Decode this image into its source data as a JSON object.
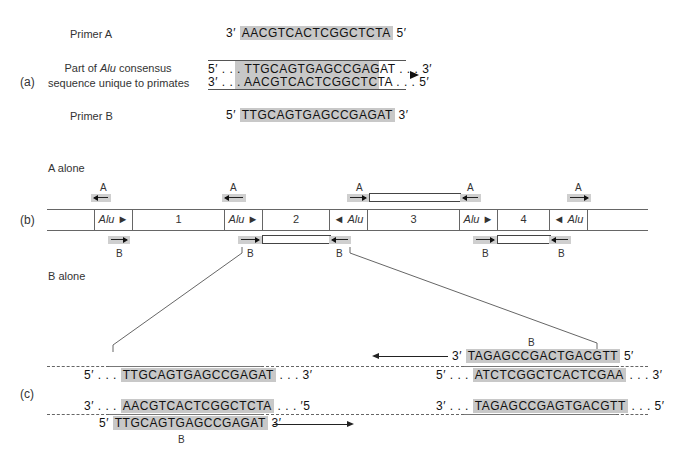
{
  "panel_a": {
    "label": "(a)",
    "primer_a": {
      "name": "Primer A",
      "left_end": "3′",
      "sequence": "AACGTCACTCGGCTCTA",
      "right_end": "5′"
    },
    "consensus": {
      "name_prefix": "Part of ",
      "name_italic": "Alu",
      "name_suffix": " consensus",
      "name_line2": "sequence unique to primates",
      "top_strand": {
        "left_end": "5′ . . .",
        "sequence": "TTGCAGTGAGCCGAGAT",
        "right_end": ". . . 3′"
      },
      "bottom_strand": {
        "left_end": "3′ . . .",
        "sequence": "AACGTCACTCGGCTCTA",
        "right_end": ". . . 5′"
      },
      "direction_icon": "right-arrowhead"
    },
    "primer_b": {
      "name": "Primer B",
      "left_end": "5′",
      "sequence": "TTGCAGTGAGCCGAGAT",
      "right_end": "3′"
    }
  },
  "panel_b": {
    "label": "(b)",
    "a_alone_label": "A alone",
    "b_alone_label": "B alone",
    "segments": [
      {
        "type": "flank",
        "text": ""
      },
      {
        "type": "alu",
        "text": "Alu",
        "dir": "right"
      },
      {
        "type": "region",
        "text": "1"
      },
      {
        "type": "alu",
        "text": "Alu",
        "dir": "right"
      },
      {
        "type": "region",
        "text": "2"
      },
      {
        "type": "alu",
        "text": "Alu",
        "dir": "left"
      },
      {
        "type": "region",
        "text": "3"
      },
      {
        "type": "alu",
        "text": "Alu",
        "dir": "right"
      },
      {
        "type": "region",
        "text": "4"
      },
      {
        "type": "alu",
        "text": "Alu",
        "dir": "left"
      },
      {
        "type": "flank",
        "text": ""
      }
    ],
    "primer_label_a": "A",
    "primer_label_b": "B"
  },
  "panel_c": {
    "label": "(c)",
    "left_top": {
      "left_end": "5′ . . .",
      "sequence": "TTGCAGTGAGCCGAGAT",
      "right_end": ". . . 3′"
    },
    "left_bottom": {
      "left_end": "3′ . . .",
      "sequence": "AACGTCACTCGGCTCTA",
      "right_end": ". . . ′5"
    },
    "left_primer": {
      "left_end": "5′",
      "sequence": "TTGCAGTGAGCCGAGAT",
      "right_end": "3′",
      "label": "B"
    },
    "right_primer": {
      "left_end": "3′",
      "sequence": "TAGAGCCGACTGACGTT",
      "right_end": "5′",
      "label": "B"
    },
    "right_top": {
      "left_end": "5′ . . .",
      "sequence": "ATCTCGGCTCACTCGAA",
      "right_end": ". . . 3′"
    },
    "right_bottom": {
      "left_end": "3′ . . .",
      "sequence": "TAGAGCCGAGTGACGTT",
      "right_end": ". . . 5′"
    }
  }
}
